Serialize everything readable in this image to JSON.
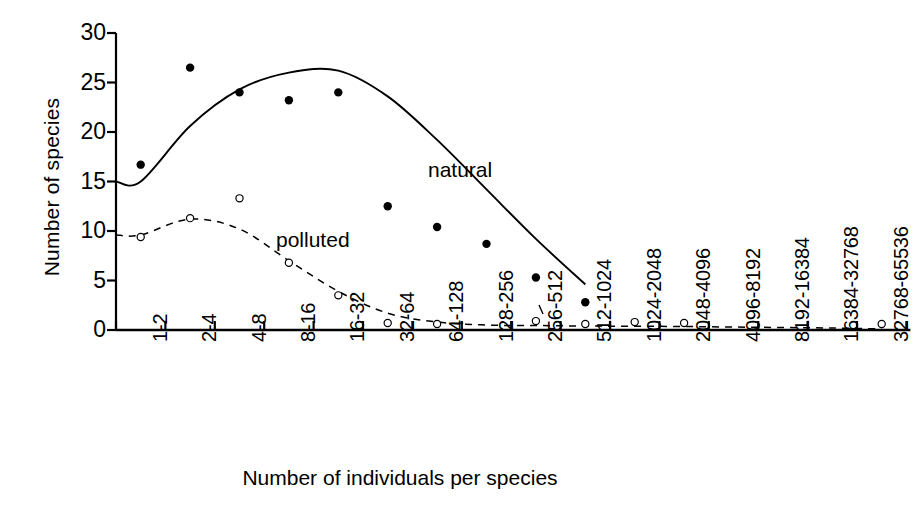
{
  "chart_data": {
    "type": "scatter",
    "title": "",
    "xlabel": "Number of individuals per species",
    "ylabel": "Number of species",
    "ylim": [
      0,
      30
    ],
    "yticks": [
      0,
      5,
      10,
      15,
      20,
      25,
      30
    ],
    "grid": false,
    "legend_position": "inline-annotation",
    "categories": [
      "1-2",
      "2-4",
      "4-8",
      "8-16",
      "16-32",
      "32-64",
      "64-128",
      "128-256",
      "256-512",
      "512-1024",
      "1024-2048",
      "2048-4096",
      "4096-8192",
      "8192-16384",
      "16384-32768",
      "32768-65536"
    ],
    "series": [
      {
        "name": "natural",
        "marker": "filled-circle",
        "line_style": "solid",
        "values": [
          16.7,
          26.5,
          24.0,
          23.2,
          24.0,
          12.5,
          10.4,
          8.7,
          5.3,
          2.8,
          null,
          null,
          null,
          null,
          null,
          null
        ],
        "fit_curve": [
          15.0,
          20.6,
          24.3,
          26.0,
          26.2,
          23.6,
          19.2,
          14.2,
          9.2,
          4.6,
          null,
          null,
          null,
          null,
          null,
          null
        ]
      },
      {
        "name": "polluted",
        "marker": "open-circle",
        "line_style": "dashed",
        "values": [
          9.4,
          11.3,
          13.3,
          6.8,
          3.5,
          0.7,
          0.6,
          null,
          0.9,
          0.6,
          0.8,
          0.7,
          null,
          null,
          null,
          0.6
        ],
        "fit_curve": [
          9.6,
          11.2,
          10.2,
          7.0,
          3.9,
          1.7,
          0.8,
          0.5,
          0.45,
          0.4,
          0.38,
          0.35,
          0.3,
          0.25,
          0.2,
          0.1
        ]
      }
    ],
    "annotations": [
      {
        "text": "natural",
        "series": "natural"
      },
      {
        "text": "polluted",
        "series": "polluted"
      }
    ]
  },
  "axes": {
    "y_tick_labels": [
      "30",
      "25",
      "20",
      "15",
      "10",
      "5",
      "0"
    ],
    "y_title": "Number of species",
    "x_title": "Number of individuals per species",
    "x_tick_labels": [
      "1-2",
      "2-4",
      "4-8",
      "8-16",
      "16-32",
      "32-64",
      "64-128",
      "128-256",
      "256-512",
      "512-1024",
      "1024-2048",
      "2048-4096",
      "4096-8192",
      "8192-16384",
      "16384-32768",
      "32768-65536"
    ]
  },
  "style": {
    "line_color": "#000000",
    "background": "#ffffff"
  }
}
